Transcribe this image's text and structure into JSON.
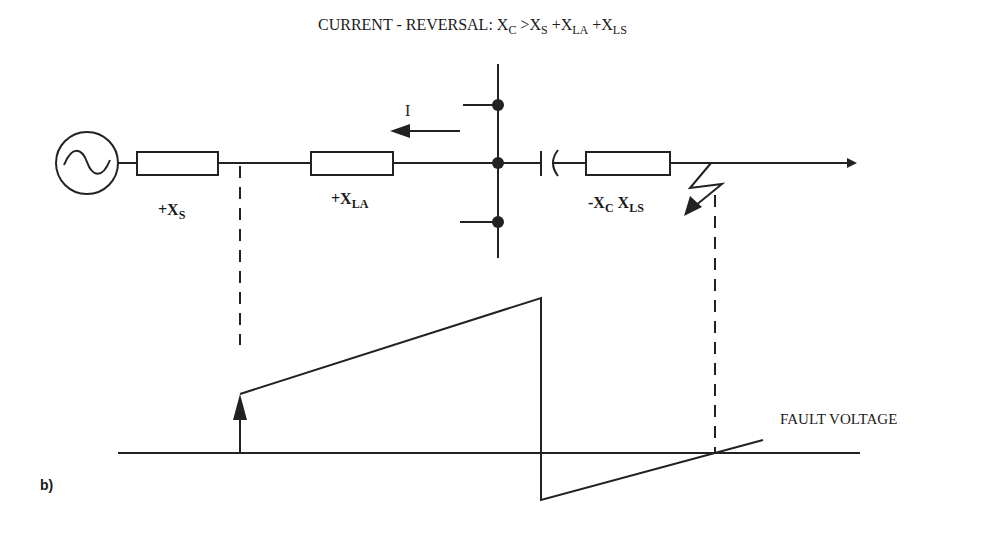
{
  "title": {
    "prefix": "CURRENT - REVERSAL: X",
    "sub_c": "C",
    "gt": " >X",
    "sub_s": "S",
    "plus1": " +X",
    "sub_la": "LA",
    "plus2": " +X",
    "sub_ls": "LS"
  },
  "current_label": "I",
  "components": {
    "source": {
      "symbol": "ac-source"
    },
    "xs": {
      "main": "+X",
      "sub": "S"
    },
    "xla": {
      "main": "+X",
      "sub": "LA"
    },
    "xc_xls": {
      "main1": "-X",
      "sub1": "C",
      "main2": " X",
      "sub2": "LS"
    }
  },
  "waveform_label": "FAULT VOLTAGE",
  "figure_label": "b)",
  "colors": {
    "line": "#222222",
    "background": "#ffffff"
  }
}
